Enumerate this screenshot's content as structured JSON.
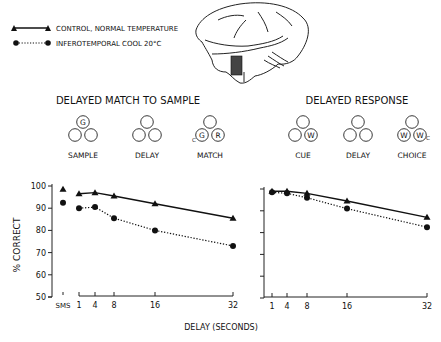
{
  "legend": {
    "items": [
      {
        "label": "CONTROL, NORMAL TEMPERATURE",
        "marker": "triangle",
        "line": "solid"
      },
      {
        "label": "INFEROTEMPORAL COOL 20°C",
        "marker": "circle",
        "line": "dotted"
      }
    ]
  },
  "brain_illustration": {
    "label": "brain-lateral-view",
    "shaded_region": "inferotemporal cortex"
  },
  "tasks": [
    {
      "title": "DELAYED MATCH TO SAMPLE",
      "stages": [
        {
          "label": "SAMPLE",
          "circles": [
            "G",
            "",
            ""
          ],
          "subscript": ""
        },
        {
          "label": "DELAY",
          "circles": [
            "",
            "",
            ""
          ],
          "subscript": ""
        },
        {
          "label": "MATCH",
          "circles": [
            "",
            "G",
            "R"
          ],
          "subscript": "C"
        }
      ]
    },
    {
      "title": "DELAYED RESPONSE",
      "stages": [
        {
          "label": "CUE",
          "circles": [
            "",
            "",
            "W"
          ],
          "subscript": ""
        },
        {
          "label": "DELAY",
          "circles": [
            "",
            "",
            ""
          ],
          "subscript": ""
        },
        {
          "label": "CHOICE",
          "circles": [
            "",
            "W",
            "W"
          ],
          "subscript": "C"
        }
      ]
    }
  ],
  "chart_data": [
    {
      "type": "line",
      "title": "DELAYED MATCH TO SAMPLE",
      "xlabel": "DELAY (SECONDS)",
      "ylabel": "% CORRECT",
      "ylim": [
        50,
        100
      ],
      "yticks": [
        50,
        60,
        70,
        80,
        90,
        100
      ],
      "xticks": [
        1,
        4,
        8,
        16,
        32
      ],
      "extra_category": "SMS",
      "x": [
        1,
        4,
        8,
        16,
        32
      ],
      "series": [
        {
          "name": "CONTROL, NORMAL TEMPERATURE",
          "marker": "triangle",
          "line": "solid",
          "sms": 98.5,
          "values": [
            96.5,
            97,
            95.5,
            92,
            85.5
          ]
        },
        {
          "name": "INFEROTEMPORAL COOL 20°C",
          "marker": "circle",
          "line": "dotted",
          "sms": 92.5,
          "values": [
            90,
            90.5,
            85.5,
            80,
            73
          ]
        }
      ],
      "grid": false
    },
    {
      "type": "line",
      "title": "DELAYED RESPONSE",
      "xlabel": "DELAY (SECONDS)",
      "ylabel": "",
      "ylim": [
        50,
        100
      ],
      "yticks": [
        50,
        60,
        70,
        80,
        90,
        100
      ],
      "xticks": [
        1,
        4,
        8,
        16,
        32
      ],
      "x": [
        1,
        4,
        8,
        16,
        32
      ],
      "series": [
        {
          "name": "CONTROL, NORMAL TEMPERATURE",
          "marker": "triangle",
          "line": "solid",
          "values": [
            99,
            99,
            98,
            94.5,
            87
          ]
        },
        {
          "name": "INFEROTEMPORAL COOL 20°C",
          "marker": "circle",
          "line": "dotted",
          "values": [
            98.5,
            98,
            96,
            91,
            82.5
          ]
        }
      ],
      "grid": false
    }
  ],
  "shared_xlabel": "DELAY  (SECONDS)",
  "shared_ylabel": "% CORRECT"
}
